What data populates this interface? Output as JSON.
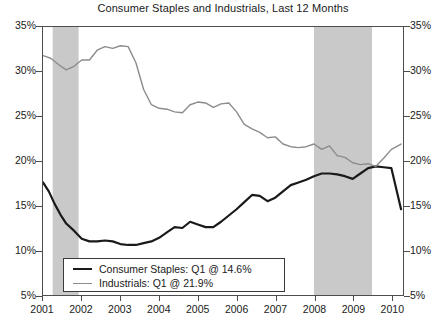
{
  "chart_data": {
    "type": "line",
    "title": "Consumer Staples and Industrials, Last 12 Months",
    "xlabel": "",
    "ylabel": "",
    "ylim": [
      5,
      35
    ],
    "xlim": [
      2001.0,
      2010.3
    ],
    "ytick_labels": [
      "35%",
      "30%",
      "25%",
      "20%",
      "15%",
      "10%",
      "5%"
    ],
    "ytick_values": [
      35,
      30,
      25,
      20,
      15,
      10,
      5
    ],
    "yaxis_right_labels": [
      "35%",
      "30%",
      "25%",
      "20%",
      "15%",
      "10%",
      "5%"
    ],
    "xtick_labels": [
      "2001",
      "2002",
      "2003",
      "2004",
      "2005",
      "2006",
      "2007",
      "2008",
      "2009",
      "2010"
    ],
    "xtick_values": [
      2001,
      2002,
      2003,
      2004,
      2005,
      2006,
      2007,
      2008,
      2009,
      2010
    ],
    "grid": false,
    "legend_position": "lower-left",
    "shaded_regions": [
      {
        "name": "recession-band-2001",
        "start": 2001.25,
        "end": 2001.92
      },
      {
        "name": "recession-band-2008",
        "start": 2008.0,
        "end": 2009.5
      }
    ],
    "shade_color": "#c9c9c9",
    "series": [
      {
        "name": "Consumer Staples",
        "color": "#1a1a1a",
        "legend_label": "Consumer Staples: Q1 @ 14.6%",
        "last_value": 14.6,
        "x": [
          2001.0,
          2001.15,
          2001.3,
          2001.45,
          2001.6,
          2001.8,
          2002.0,
          2002.2,
          2002.4,
          2002.6,
          2002.8,
          2003.0,
          2003.2,
          2003.4,
          2003.6,
          2003.8,
          2004.0,
          2004.2,
          2004.4,
          2004.6,
          2004.8,
          2005.0,
          2005.2,
          2005.4,
          2005.6,
          2005.8,
          2006.0,
          2006.2,
          2006.4,
          2006.6,
          2006.8,
          2007.0,
          2007.2,
          2007.4,
          2007.6,
          2007.8,
          2008.0,
          2008.2,
          2008.4,
          2008.6,
          2008.8,
          2009.0,
          2009.2,
          2009.4,
          2009.6,
          2009.8,
          2010.0,
          2010.25
        ],
        "values": [
          17.6,
          16.6,
          15.2,
          14.0,
          13.0,
          12.2,
          11.3,
          11.0,
          11.0,
          11.1,
          11.0,
          10.7,
          10.6,
          10.6,
          10.8,
          11.0,
          11.4,
          12.0,
          12.6,
          12.5,
          13.2,
          12.9,
          12.6,
          12.6,
          13.2,
          13.9,
          14.6,
          15.4,
          16.2,
          16.1,
          15.5,
          15.9,
          16.6,
          17.3,
          17.6,
          17.9,
          18.3,
          18.6,
          18.6,
          18.5,
          18.3,
          18.0,
          18.6,
          19.2,
          19.4,
          19.3,
          19.2,
          14.6
        ]
      },
      {
        "name": "Industrials",
        "color": "#8c8c8c",
        "legend_label": "Industrials: Q1 @ 21.9%",
        "last_value": 21.9,
        "x": [
          2001.0,
          2001.2,
          2001.4,
          2001.6,
          2001.8,
          2002.0,
          2002.2,
          2002.4,
          2002.6,
          2002.8,
          2003.0,
          2003.2,
          2003.4,
          2003.6,
          2003.8,
          2004.0,
          2004.2,
          2004.4,
          2004.6,
          2004.8,
          2005.0,
          2005.2,
          2005.4,
          2005.6,
          2005.8,
          2006.0,
          2006.2,
          2006.4,
          2006.6,
          2006.8,
          2007.0,
          2007.2,
          2007.4,
          2007.6,
          2007.8,
          2008.0,
          2008.2,
          2008.4,
          2008.6,
          2008.8,
          2009.0,
          2009.2,
          2009.4,
          2009.6,
          2009.8,
          2010.0,
          2010.25
        ],
        "values": [
          31.8,
          31.5,
          30.8,
          30.2,
          30.6,
          31.3,
          31.3,
          32.4,
          32.8,
          32.6,
          32.9,
          32.8,
          31.0,
          28.0,
          26.3,
          25.9,
          25.8,
          25.5,
          25.4,
          26.3,
          26.6,
          26.5,
          26.0,
          26.4,
          26.5,
          25.5,
          24.1,
          23.6,
          23.2,
          22.6,
          22.7,
          21.9,
          21.6,
          21.5,
          21.6,
          21.9,
          21.3,
          21.7,
          20.6,
          20.4,
          19.8,
          19.6,
          19.7,
          19.4,
          20.3,
          21.3,
          21.9
        ]
      }
    ]
  },
  "legend": {
    "staples_label": "Consumer Staples: Q1 @ 14.6%",
    "industrials_label": "Industrials: Q1 @ 21.9%"
  }
}
